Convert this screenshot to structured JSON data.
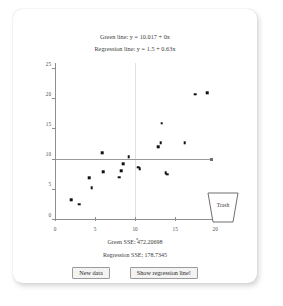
{
  "header": {
    "green_line_eq": "Green line: y = 10.017 + 0x",
    "regression_line_eq": "Regression line: y = 1.5 + 0.63x"
  },
  "footer": {
    "green_sse": "Green SSE: 472.20698",
    "regression_sse": "Regression SSE: 178.7345",
    "new_data_label": "New data",
    "show_regression_label": "Show regression line!"
  },
  "trash": {
    "label": "Trash"
  },
  "chart_data": {
    "type": "scatter",
    "title": "",
    "xlabel": "x",
    "ylabel": "",
    "xlim": [
      0,
      20.6
    ],
    "ylim": [
      0,
      26
    ],
    "xticks": [
      0,
      5,
      10,
      15,
      20
    ],
    "yticks": [
      0,
      5,
      10,
      15,
      20,
      25
    ],
    "xticklabels": [
      "0",
      "5",
      "10",
      "15",
      "20"
    ],
    "yticklabels": [
      "0",
      "5",
      "10",
      "15",
      "20",
      "25"
    ],
    "grid": false,
    "legend": "none",
    "points": [
      {
        "x": 2.0,
        "y": 3.3
      },
      {
        "x": 3.0,
        "y": 2.6
      },
      {
        "x": 4.3,
        "y": 7.0
      },
      {
        "x": 4.6,
        "y": 5.3
      },
      {
        "x": 5.9,
        "y": 11.1
      },
      {
        "x": 6.0,
        "y": 8.0
      },
      {
        "x": 8.0,
        "y": 7.1
      },
      {
        "x": 8.3,
        "y": 8.2
      },
      {
        "x": 8.5,
        "y": 9.3
      },
      {
        "x": 9.2,
        "y": 10.5
      },
      {
        "x": 10.4,
        "y": 8.7
      },
      {
        "x": 10.6,
        "y": 8.5
      },
      {
        "x": 12.9,
        "y": 12.1
      },
      {
        "x": 13.2,
        "y": 12.8
      },
      {
        "x": 13.3,
        "y": 16.0
      },
      {
        "x": 13.8,
        "y": 7.8
      },
      {
        "x": 14.0,
        "y": 7.6
      },
      {
        "x": 16.2,
        "y": 12.8
      },
      {
        "x": 17.5,
        "y": 20.8
      },
      {
        "x": 19.0,
        "y": 21.1
      }
    ],
    "green_line": {
      "intercept": 10.017,
      "slope": 0,
      "color": "#9a9a9a",
      "x_start": 0,
      "x_end": 19.5,
      "endpoint_marker": true
    },
    "regression_line": {
      "intercept": 1.5,
      "slope": 0.63,
      "visible": false
    },
    "gridline_x": 10,
    "sse_green": 472.20698,
    "sse_regression": 178.7345
  }
}
